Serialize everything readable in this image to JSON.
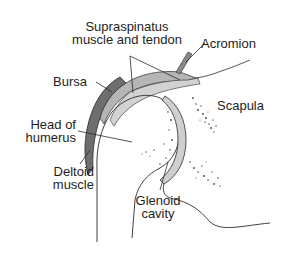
{
  "labels": {
    "supraspinatus_line1": "Supraspinatus",
    "supraspinatus_line2": "muscle and tendon",
    "acromion": "Acromion",
    "bursa": "Bursa",
    "scapula": "Scapula",
    "head_of_humerus_line1": "Head of",
    "head_of_humerus_line2": "humerus",
    "deltoid_line1": "Deltoid",
    "deltoid_line2": "muscle",
    "glenoid_line1": "Glenoid",
    "glenoid_line2": "cavity"
  },
  "colors": {
    "line": "#2a2a2a",
    "deltoid_fill": "#6e6e6e",
    "cartilage_fill": "#cfcfcf",
    "tendon_fill": "#9a9a9a",
    "stipple": "#4a4a4a"
  }
}
